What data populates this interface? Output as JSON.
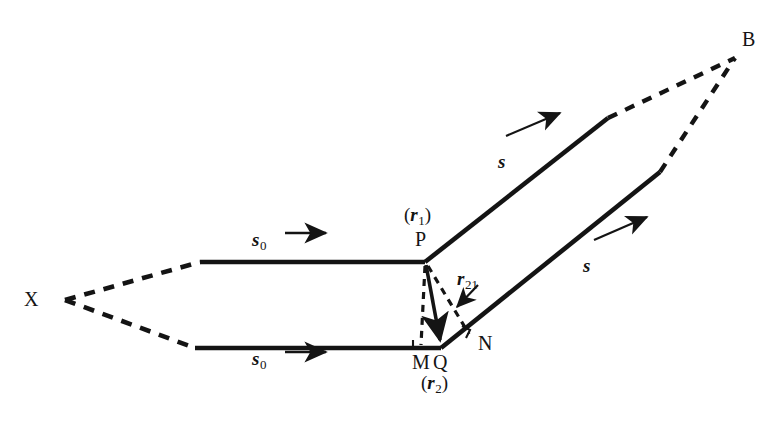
{
  "figure": {
    "background_color": "#ffffff",
    "line_color": "#141414",
    "text_color": "#141414"
  },
  "points": {
    "source": {
      "label": "X",
      "x": 65,
      "y": 300,
      "label_x": 24,
      "label_y": 289
    },
    "upper_scatter": {
      "label": "P",
      "x": 425,
      "y": 262,
      "label_x": 415,
      "label_y": 229
    },
    "foot_perpendicular": {
      "label": "M",
      "x": 421,
      "y": 348,
      "label_x": 412,
      "label_y": 352
    },
    "lower_scatter": {
      "label": "Q",
      "x": 441,
      "y": 348,
      "label_x": 433,
      "label_y": 352
    },
    "foot_outgoing": {
      "label": "N",
      "x": 470,
      "y": 337,
      "label_x": 478,
      "label_y": 333
    },
    "detector": {
      "label": "B",
      "x": 735,
      "y": 58,
      "label_x": 742,
      "label_y": 29
    }
  },
  "vectors": {
    "incident_upper": {
      "label": "s",
      "subscript": "0",
      "label_x": 252,
      "label_y": 230
    },
    "incident_lower": {
      "label": "s",
      "subscript": "0",
      "label_x": 252,
      "label_y": 349
    },
    "scattered_upper": {
      "label": "s",
      "subscript": "",
      "label_x": 498,
      "label_y": 152
    },
    "scattered_lower": {
      "label": "s",
      "subscript": "",
      "label_x": 583,
      "label_y": 256
    },
    "position_upper": {
      "open_paren": "(",
      "symbol": "r",
      "subscript": "1",
      "close_paren": ")",
      "label_x": 404,
      "label_y": 205
    },
    "position_lower": {
      "open_paren": "(",
      "symbol": "r",
      "subscript": "2",
      "close_paren": ")",
      "label_x": 421,
      "label_y": 373
    },
    "separation": {
      "symbol": "r",
      "subscript": "21",
      "label_x": 457,
      "label_y": 269
    }
  },
  "geometry": {
    "upper_ray": {
      "dashed_from": [
        65,
        300
      ],
      "dashed_to": [
        200,
        262
      ],
      "solid_from": [
        200,
        262
      ],
      "solid_to": [
        425,
        262
      ]
    },
    "lower_ray": {
      "dashed_from": [
        65,
        300
      ],
      "dashed_to": [
        195,
        348
      ],
      "solid_from": [
        195,
        348
      ],
      "solid_to": [
        441,
        348
      ]
    },
    "upper_out": {
      "solid_from": [
        425,
        262
      ],
      "solid_to": [
        608,
        118
      ],
      "dashed_from": [
        608,
        118
      ],
      "dashed_to": [
        735,
        58
      ]
    },
    "lower_out": {
      "solid_from": [
        441,
        348
      ],
      "solid_to": [
        660,
        172
      ],
      "dashed_from": [
        660,
        172
      ],
      "dashed_to": [
        735,
        58
      ]
    },
    "perpendicular_PM": {
      "from": [
        425,
        262
      ],
      "to": [
        421,
        348
      ],
      "style": "dashed"
    },
    "perpendicular_PN": {
      "from": [
        425,
        262
      ],
      "to": [
        470,
        337
      ],
      "style": "dashed"
    },
    "vector_PQ": {
      "from": [
        425,
        262
      ],
      "to": [
        441,
        348
      ],
      "style": "solid-arrow"
    },
    "right_angle_at_M": {
      "x": 421,
      "y": 348
    },
    "right_angle_at_N": {
      "x": 470,
      "y": 337
    },
    "arrow_s0_upper": {
      "from": [
        285,
        233
      ],
      "to": [
        330,
        233
      ]
    },
    "arrow_s0_lower": {
      "from": [
        285,
        352
      ],
      "to": [
        330,
        352
      ]
    },
    "arrow_s_upper": {
      "from": [
        506,
        136
      ],
      "to": [
        563,
        112
      ]
    },
    "arrow_s_lower": {
      "from": [
        594,
        240
      ],
      "to": [
        650,
        215
      ]
    },
    "pointer_to_r21": {
      "from": [
        478,
        286
      ],
      "to": [
        455,
        310
      ]
    }
  }
}
